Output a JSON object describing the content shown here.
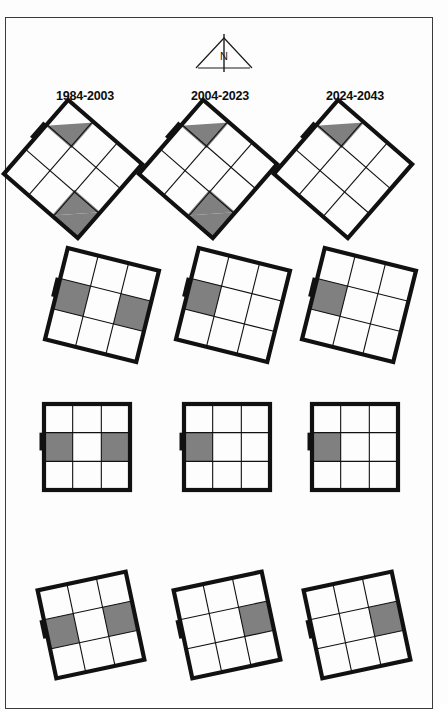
{
  "figure": {
    "background_color": "#fdfdfd",
    "frame_color": "#3a3a3a",
    "shade_color": "#808080",
    "line_color": "#111111"
  },
  "north_arrow": {
    "label": "N",
    "icon": "north-arrow-icon"
  },
  "columns": [
    {
      "label": "1984-2003"
    },
    {
      "label": "2004-2023"
    },
    {
      "label": "2024-2043"
    }
  ],
  "chart_data": {
    "type": "diagram",
    "title": "",
    "grid_rows": 4,
    "grid_cols": 3,
    "subgrid": 3,
    "legend": [],
    "cells": [
      {
        "row": 0,
        "col": 0,
        "period": "1984-2003",
        "rotation_deg": 41,
        "x": 24,
        "y": 120,
        "size": 98,
        "shaded": [
          "0,0",
          "2,2"
        ],
        "shade_mode": "triangle-tl-and-triangle-br"
      },
      {
        "row": 0,
        "col": 1,
        "period": "2004-2023",
        "rotation_deg": 41,
        "x": 159,
        "y": 120,
        "size": 98,
        "shaded": [
          "0,0",
          "2,2"
        ],
        "shade_mode": "triangle-tl-and-triangle-br"
      },
      {
        "row": 0,
        "col": 2,
        "period": "2024-2043",
        "rotation_deg": 41,
        "x": 294,
        "y": 120,
        "size": 98,
        "shaded": [
          "0,0"
        ],
        "shade_mode": "triangle-tl"
      },
      {
        "row": 1,
        "col": 0,
        "period": "1984-2003",
        "rotation_deg": 14,
        "x": 55,
        "y": 258,
        "size": 94,
        "shaded": [
          "1,0",
          "1,2"
        ],
        "shade_mode": "cells"
      },
      {
        "row": 1,
        "col": 1,
        "period": "2004-2023",
        "rotation_deg": 14,
        "x": 186,
        "y": 258,
        "size": 94,
        "shaded": [
          "1,0"
        ],
        "shade_mode": "cells"
      },
      {
        "row": 1,
        "col": 2,
        "period": "2024-2043",
        "rotation_deg": 14,
        "x": 312,
        "y": 258,
        "size": 94,
        "shaded": [
          "1,0"
        ],
        "shade_mode": "cells"
      },
      {
        "row": 2,
        "col": 0,
        "period": "1984-2003",
        "rotation_deg": 0,
        "x": 44,
        "y": 404,
        "size": 86,
        "shaded": [
          "1,0",
          "1,2"
        ],
        "shade_mode": "cells"
      },
      {
        "row": 2,
        "col": 1,
        "period": "2004-2023",
        "rotation_deg": 0,
        "x": 184,
        "y": 404,
        "size": 86,
        "shaded": [
          "1,0"
        ],
        "shade_mode": "cells"
      },
      {
        "row": 2,
        "col": 2,
        "period": "2024-2043",
        "rotation_deg": 0,
        "x": 312,
        "y": 404,
        "size": 86,
        "shaded": [
          "1,0"
        ],
        "shade_mode": "cells"
      },
      {
        "row": 3,
        "col": 0,
        "period": "1984-2003",
        "rotation_deg": -12,
        "x": 46,
        "y": 580,
        "size": 90,
        "shaded": [
          "1,0",
          "1,2"
        ],
        "shade_mode": "cells"
      },
      {
        "row": 3,
        "col": 1,
        "period": "2004-2023",
        "rotation_deg": -12,
        "x": 182,
        "y": 580,
        "size": 90,
        "shaded": [
          "1,2"
        ],
        "shade_mode": "cells"
      },
      {
        "row": 3,
        "col": 2,
        "period": "2024-2043",
        "rotation_deg": -12,
        "x": 312,
        "y": 580,
        "size": 90,
        "shaded": [
          "1,2"
        ],
        "shade_mode": "cells"
      }
    ]
  }
}
